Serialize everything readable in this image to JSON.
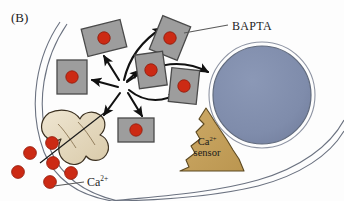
{
  "figure": {
    "panel_letter": "(B)",
    "background_color": "#fdfdfd"
  },
  "labels": {
    "bapta": "BAPTA",
    "calcium_ion": "Ca",
    "calcium_ion_charge": "2+",
    "sensor_line1": "Ca",
    "sensor_line1_charge": "2+",
    "sensor_line2": "sensor"
  },
  "colors": {
    "bapta_fill": "#9d9d9d",
    "bapta_stroke": "#4a4a4a",
    "calcium_dot": "#cc2a14",
    "calcium_dot_stroke": "#8f1c0c",
    "nucleus_fill": "#7f8cab",
    "nucleus_stroke": "#59606e",
    "sensor_fill": "#c6a15c",
    "sensor_stroke": "#5d4a22",
    "channel_fill": "#e6dbc2",
    "channel_stroke": "#3b3020",
    "membrane_stroke": "#6b7280",
    "arrow_stroke": "#111111",
    "leader_stroke": "#5a5a5a",
    "text": "#1c1c1c"
  },
  "elements": {
    "bapta_molecules": [
      {
        "id": "bapta-top-left",
        "cx": 104,
        "cy": 38,
        "w": 40,
        "h": 28,
        "rot": -14
      },
      {
        "id": "bapta-left",
        "cx": 72,
        "cy": 77,
        "w": 30,
        "h": 34,
        "rot": 0
      },
      {
        "id": "bapta-top-right",
        "cx": 170,
        "cy": 38,
        "w": 30,
        "h": 36,
        "rot": 22
      },
      {
        "id": "bapta-mid-center",
        "cx": 151,
        "cy": 70,
        "w": 28,
        "h": 34,
        "rot": -8
      },
      {
        "id": "bapta-mid-right",
        "cx": 184,
        "cy": 86,
        "w": 28,
        "h": 34,
        "rot": 6
      },
      {
        "id": "bapta-bottom",
        "cx": 136,
        "cy": 130,
        "w": 36,
        "h": 24,
        "rot": 0
      }
    ],
    "free_calcium_dots": [
      {
        "cx": 30,
        "cy": 153
      },
      {
        "cx": 52,
        "cy": 143
      },
      {
        "cx": 53,
        "cy": 163
      },
      {
        "cx": 50,
        "cy": 182
      },
      {
        "cx": 71,
        "cy": 173
      },
      {
        "cx": 18,
        "cy": 172
      }
    ],
    "arrow_hub": {
      "x": 123,
      "y": 86
    },
    "nucleus": {
      "cx": 262,
      "cy": 95,
      "r": 50
    },
    "sensor_triangle": {
      "apex_x": 206,
      "apex_y": 108,
      "base_left_x": 168,
      "base_left_y": 171,
      "base_right_x": 244,
      "base_right_y": 171
    },
    "channel_protein": {
      "cx": 66,
      "cy": 139
    },
    "membrane": {
      "style": "double-line",
      "description": "cell membrane drawn as two thin parallel curved lines"
    }
  }
}
